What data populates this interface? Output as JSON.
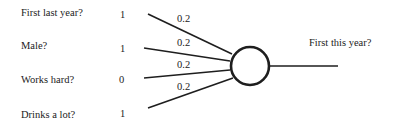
{
  "diagram": {
    "type": "perceptron",
    "inputs": [
      {
        "label": "First last year?",
        "value": "1",
        "weight": "0.2"
      },
      {
        "label": "Male?",
        "value": "1",
        "weight": "0.2"
      },
      {
        "label": "Works hard?",
        "value": "0",
        "weight": "0.2"
      },
      {
        "label": "Drinks a lot?",
        "value": "1",
        "weight": "0.2"
      }
    ],
    "output": {
      "label": "First this year?"
    },
    "colors": {
      "line": "#1e1e1e",
      "text": "#222222",
      "background": "#ffffff"
    }
  }
}
